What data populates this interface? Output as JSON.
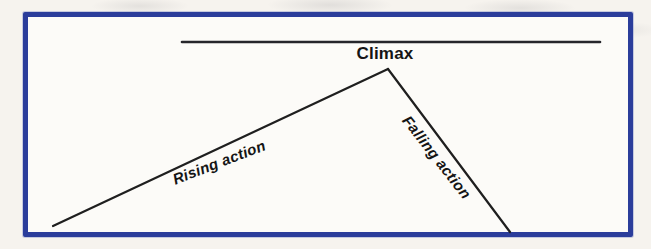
{
  "diagram": {
    "climax_label": "Climax",
    "rising_label": "Rising action",
    "falling_label": "Falling action"
  },
  "colors": {
    "frame_border": "#2b3d9b",
    "line": "#1f1f1f",
    "text": "#151515",
    "page_background": "#f6f3ee",
    "panel_background": "#fcfbf8"
  }
}
